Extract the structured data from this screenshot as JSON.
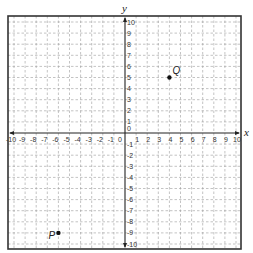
{
  "diagram": {
    "type": "coordinate-plane",
    "x_axis": {
      "label": "x",
      "min": -10,
      "max": 10,
      "step": 1
    },
    "y_axis": {
      "label": "y",
      "min": -10,
      "max": 10,
      "step": 1
    },
    "grid": {
      "style": "dashed",
      "color": "#9a9a9a"
    },
    "border_color": "#333333",
    "axis_color": "#222222",
    "points": [
      {
        "label": "Q",
        "x": 4,
        "y": 5,
        "label_offset": [
          3,
          -4
        ]
      },
      {
        "label": "P",
        "x": -6,
        "y": -9,
        "label_offset": [
          -10,
          6
        ]
      }
    ]
  },
  "chart_data": {
    "type": "scatter",
    "title": "",
    "xlabel": "x",
    "ylabel": "y",
    "xlim": [
      -10,
      10
    ],
    "ylim": [
      -10,
      10
    ],
    "grid": true,
    "series": [
      {
        "name": "points",
        "labels": [
          "Q",
          "P"
        ],
        "x": [
          4,
          -6
        ],
        "y": [
          5,
          -9
        ]
      }
    ]
  }
}
